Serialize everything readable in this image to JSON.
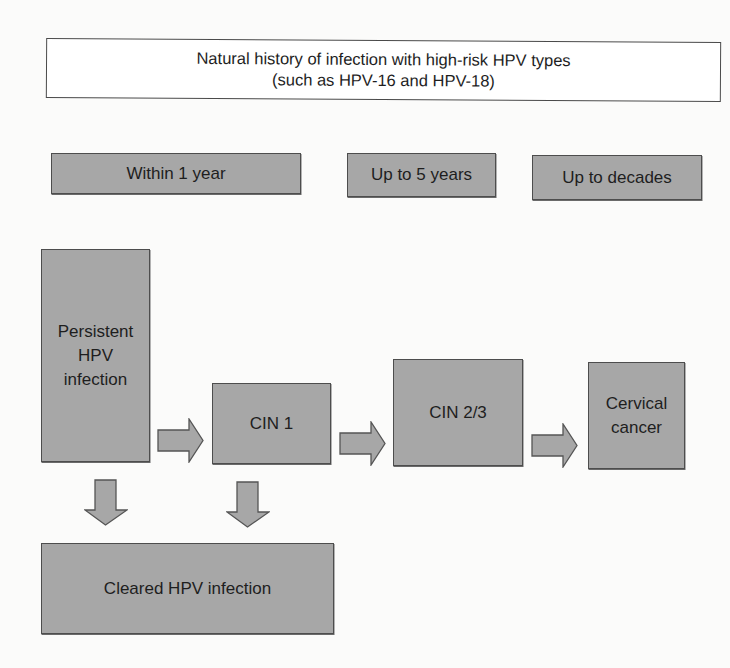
{
  "title": {
    "line1": "Natural history of infection with high-risk HPV types",
    "line2": "(such as HPV-16 and HPV-18)"
  },
  "timeline": [
    {
      "label": "Within 1 year"
    },
    {
      "label": "Up to 5 years"
    },
    {
      "label": "Up to decades"
    }
  ],
  "stages": {
    "persistent": {
      "line1": "Persistent",
      "line2": "HPV",
      "line3": "infection"
    },
    "cin1": {
      "label": "CIN 1"
    },
    "cin23": {
      "label": "CIN 2/3"
    },
    "cancer": {
      "line1": "Cervical",
      "line2": "cancer"
    },
    "cleared": {
      "label": "Cleared HPV infection"
    }
  },
  "arrows": [
    {
      "from": "Persistent HPV infection",
      "to": "CIN 1",
      "direction": "right"
    },
    {
      "from": "CIN 1",
      "to": "CIN 2/3",
      "direction": "right"
    },
    {
      "from": "CIN 2/3",
      "to": "Cervical cancer",
      "direction": "right"
    },
    {
      "from": "Persistent HPV infection",
      "to": "Cleared HPV infection",
      "direction": "down"
    },
    {
      "from": "CIN 1",
      "to": "Cleared HPV infection",
      "direction": "down"
    }
  ],
  "colors": {
    "box_fill": "#a7a7a7",
    "box_border": "#4d4d4d",
    "background": "#fbfbfa"
  }
}
